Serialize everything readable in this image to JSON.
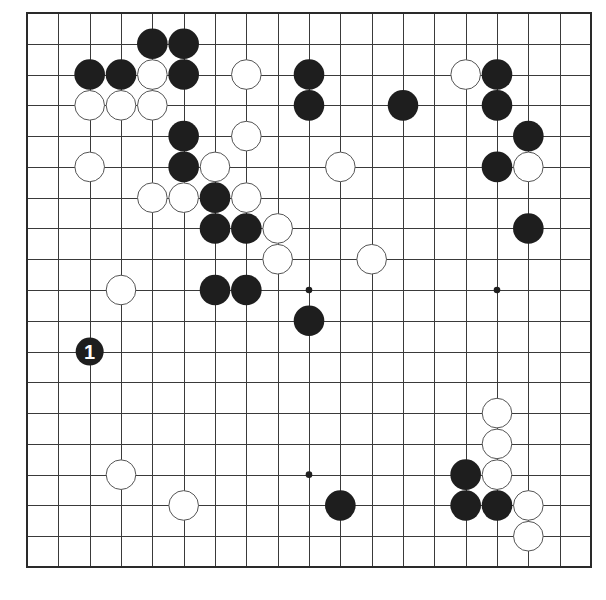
{
  "diagram": {
    "type": "go-board",
    "board_size": 19,
    "colors": {
      "background": "#ffffff",
      "line": "#3a3a3a",
      "border": "#2a2a2a",
      "black_stone": "#1e1e1e",
      "white_stone_fill": "#ffffff",
      "white_stone_outline": "#555555",
      "label_on_black": "#ffffff"
    },
    "star_points_visible": [
      [
        9,
        9
      ],
      [
        15,
        9
      ],
      [
        9,
        15
      ]
    ],
    "black_stones": [
      [
        4,
        1
      ],
      [
        5,
        1
      ],
      [
        2,
        2
      ],
      [
        3,
        2
      ],
      [
        5,
        2
      ],
      [
        9,
        2
      ],
      [
        15,
        2
      ],
      [
        9,
        3
      ],
      [
        12,
        3
      ],
      [
        15,
        3
      ],
      [
        5,
        4
      ],
      [
        16,
        4
      ],
      [
        5,
        5
      ],
      [
        15,
        5
      ],
      [
        6,
        6
      ],
      [
        6,
        7
      ],
      [
        7,
        7
      ],
      [
        16,
        7
      ],
      [
        6,
        9
      ],
      [
        7,
        9
      ],
      [
        9,
        10
      ],
      [
        14,
        15
      ],
      [
        10,
        16
      ],
      [
        14,
        16
      ],
      [
        15,
        16
      ]
    ],
    "white_stones": [
      [
        4,
        2
      ],
      [
        7,
        2
      ],
      [
        14,
        2
      ],
      [
        2,
        3
      ],
      [
        3,
        3
      ],
      [
        4,
        3
      ],
      [
        7,
        4
      ],
      [
        2,
        5
      ],
      [
        6,
        5
      ],
      [
        10,
        5
      ],
      [
        16,
        5
      ],
      [
        4,
        6
      ],
      [
        5,
        6
      ],
      [
        7,
        6
      ],
      [
        8,
        7
      ],
      [
        8,
        8
      ],
      [
        11,
        8
      ],
      [
        3,
        9
      ],
      [
        15,
        13
      ],
      [
        15,
        14
      ],
      [
        3,
        15
      ],
      [
        15,
        15
      ],
      [
        5,
        16
      ],
      [
        16,
        16
      ],
      [
        16,
        17
      ]
    ],
    "numbered_moves": [
      {
        "color": "black",
        "col": 2,
        "row": 11,
        "label": "1"
      }
    ]
  }
}
